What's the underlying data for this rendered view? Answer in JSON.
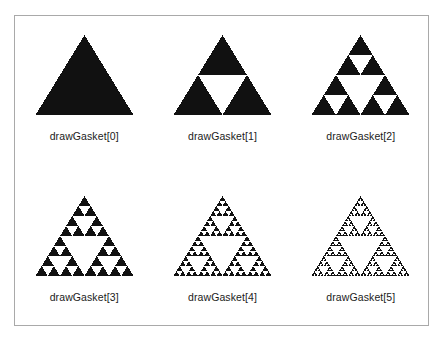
{
  "figure": {
    "kind": "sierpinski-gasket-recursion-series",
    "background_color": "#ffffff",
    "frame_border_color": "#a9a9a9",
    "fill_color": "#111111",
    "label_color": "#1b1b1b",
    "panel_count": 6,
    "rows": 2,
    "columns": 3
  },
  "panels": [
    {
      "label": "drawGasket[0]",
      "depth": 0,
      "filled_triangle_count": 1,
      "row": 1,
      "column": 1
    },
    {
      "label": "drawGasket[1]",
      "depth": 1,
      "filled_triangle_count": 3,
      "row": 1,
      "column": 2
    },
    {
      "label": "drawGasket[2]",
      "depth": 2,
      "filled_triangle_count": 9,
      "row": 1,
      "column": 3
    },
    {
      "label": "drawGasket[3]",
      "depth": 3,
      "filled_triangle_count": 27,
      "row": 2,
      "column": 1
    },
    {
      "label": "drawGasket[4]",
      "depth": 4,
      "filled_triangle_count": 81,
      "row": 2,
      "column": 2
    },
    {
      "label": "drawGasket[5]",
      "depth": 5,
      "filled_triangle_count": 243,
      "row": 2,
      "column": 3
    }
  ]
}
